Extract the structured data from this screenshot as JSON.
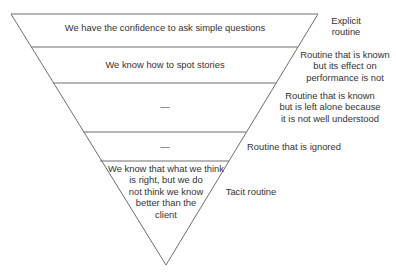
{
  "diagram": {
    "type": "inverted-pyramid",
    "colors": {
      "line": "#6e6e6e",
      "text": "#333333",
      "background": "#ffffff"
    },
    "layers": [
      {
        "inner_text": [
          "We have the confidence to ask simple questions"
        ],
        "side_label": [
          "Explicit",
          "routine"
        ]
      },
      {
        "inner_text": [
          "We know how to spot stories"
        ],
        "side_label": [
          "Routine that is known",
          "but its effect on",
          "performance is not"
        ]
      },
      {
        "inner_text": [
          "—"
        ],
        "side_label": [
          "Routine that is known",
          "but is left alone because",
          "it is not well understood"
        ]
      },
      {
        "inner_text": [
          "—"
        ],
        "side_label": [
          "Routine that is ignored"
        ]
      },
      {
        "inner_text": [
          "We know that what we think",
          "is right, but we do",
          "not think we know",
          "better than the",
          "client"
        ],
        "side_label": [
          "Tacit routine"
        ]
      }
    ]
  }
}
